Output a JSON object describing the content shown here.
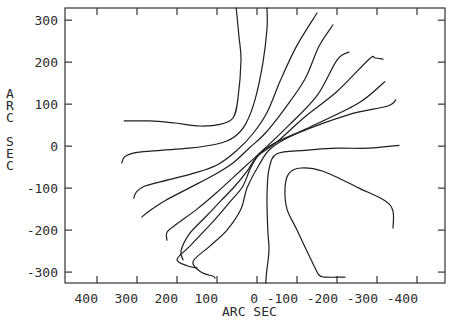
{
  "chart_data": {
    "type": "line",
    "subtype": "contour",
    "title": "",
    "xlabel": "ARC SEC",
    "ylabel": "ARC SEC",
    "xlim": [
      480,
      -470
    ],
    "ylim": [
      -326,
      329
    ],
    "x_reversed": true,
    "grid": false,
    "x_ticks": [
      400,
      300,
      200,
      100,
      0,
      -100,
      -200,
      -300,
      -400
    ],
    "x_tick_labels": [
      "400",
      "300",
      "200",
      "100",
      "0",
      "-100",
      "-200",
      "-300",
      "-400"
    ],
    "y_ticks": [
      300,
      200,
      100,
      0,
      -100,
      -200,
      -300
    ],
    "y_tick_labels": [
      "300",
      "200",
      "100",
      "0",
      "-100",
      "-200",
      "-300"
    ],
    "series": [
      {
        "name": "contour-1",
        "points": [
          [
            332,
            60
          ],
          [
            268,
            60
          ],
          [
            205,
            55
          ],
          [
            142,
            48
          ],
          [
            92,
            52
          ],
          [
            60,
            67
          ],
          [
            48,
            110
          ],
          [
            40,
            205
          ],
          [
            45,
            260
          ],
          [
            52,
            329
          ]
        ]
      },
      {
        "name": "contour-2",
        "points": [
          [
            338,
            -40
          ],
          [
            330,
            -25
          ],
          [
            300,
            -15
          ],
          [
            240,
            -10
          ],
          [
            170,
            -5
          ],
          [
            100,
            5
          ],
          [
            60,
            20
          ],
          [
            30,
            50
          ],
          [
            5,
            110
          ],
          [
            -15,
            200
          ],
          [
            -25,
            280
          ],
          [
            -25,
            329
          ]
        ]
      },
      {
        "name": "contour-3",
        "points": [
          [
            308,
            -124
          ],
          [
            302,
            -110
          ],
          [
            280,
            -95
          ],
          [
            220,
            -80
          ],
          [
            160,
            -65
          ],
          [
            100,
            -45
          ],
          [
            50,
            -10
          ],
          [
            10,
            30
          ],
          [
            -25,
            80
          ],
          [
            -60,
            160
          ],
          [
            -100,
            240
          ],
          [
            -150,
            317
          ]
        ]
      },
      {
        "name": "contour-4",
        "points": [
          [
            288,
            -169
          ],
          [
            270,
            -155
          ],
          [
            230,
            -130
          ],
          [
            170,
            -100
          ],
          [
            110,
            -70
          ],
          [
            60,
            -40
          ],
          [
            20,
            -5
          ],
          [
            -20,
            30
          ],
          [
            -70,
            90
          ],
          [
            -120,
            160
          ],
          [
            -155,
            238
          ],
          [
            -190,
            289
          ]
        ]
      },
      {
        "name": "contour-5",
        "points": [
          [
            225,
            -224
          ],
          [
            225,
            -205
          ],
          [
            200,
            -185
          ],
          [
            150,
            -150
          ],
          [
            100,
            -110
          ],
          [
            60,
            -75
          ],
          [
            20,
            -40
          ],
          [
            -20,
            -5
          ],
          [
            -80,
            50
          ],
          [
            -150,
            120
          ],
          [
            -200,
            205
          ],
          [
            -230,
            224
          ]
        ]
      },
      {
        "name": "contour-6",
        "points": [
          [
            185,
            -271
          ],
          [
            190,
            -250
          ],
          [
            170,
            -210
          ],
          [
            130,
            -170
          ],
          [
            90,
            -130
          ],
          [
            55,
            -95
          ],
          [
            25,
            -60
          ],
          [
            0,
            -25
          ],
          [
            -50,
            10
          ],
          [
            -120,
            70
          ],
          [
            -200,
            130
          ],
          [
            -280,
            207
          ],
          [
            -295,
            210
          ],
          [
            -315,
            207
          ]
        ]
      },
      {
        "name": "contour-7",
        "points": [
          [
            150,
            -290
          ],
          [
            175,
            -285
          ],
          [
            200,
            -270
          ],
          [
            170,
            -240
          ],
          [
            110,
            -180
          ],
          [
            65,
            -130
          ],
          [
            35,
            -95
          ],
          [
            15,
            -50
          ],
          [
            -10,
            -15
          ],
          [
            -50,
            10
          ],
          [
            -120,
            40
          ],
          [
            -250,
            100
          ],
          [
            -315,
            150
          ],
          [
            -315,
            150
          ]
        ]
      },
      {
        "name": "contour-8",
        "points": [
          [
            105,
            -314
          ],
          [
            110,
            -310
          ],
          [
            140,
            -300
          ],
          [
            160,
            -275
          ],
          [
            120,
            -240
          ],
          [
            75,
            -200
          ],
          [
            40,
            -150
          ],
          [
            25,
            -100
          ],
          [
            -5,
            -45
          ],
          [
            -35,
            -5
          ],
          [
            -100,
            30
          ],
          [
            -230,
            75
          ],
          [
            -325,
            95
          ],
          [
            -347,
            110
          ]
        ]
      },
      {
        "name": "contour-9",
        "points": [
          [
            -22,
            -326
          ],
          [
            -24,
            -300
          ],
          [
            -28,
            -270
          ],
          [
            -30,
            -240
          ],
          [
            -27,
            -200
          ],
          [
            -25,
            -120
          ],
          [
            -30,
            -55
          ],
          [
            -50,
            -18
          ],
          [
            -120,
            -10
          ],
          [
            -200,
            -5
          ],
          [
            -280,
            -5
          ],
          [
            -355,
            2
          ]
        ]
      },
      {
        "name": "contour-10",
        "points": [
          [
            -220,
            -312
          ],
          [
            -170,
            -312
          ],
          [
            -155,
            -307
          ],
          [
            -140,
            -280
          ],
          [
            -100,
            -200
          ],
          [
            -75,
            -150
          ],
          [
            -70,
            -100
          ],
          [
            -80,
            -65
          ],
          [
            -110,
            -52
          ],
          [
            -165,
            -60
          ],
          [
            -255,
            -100
          ],
          [
            -320,
            -130
          ],
          [
            -340,
            -155
          ],
          [
            -340,
            -195
          ]
        ]
      }
    ]
  }
}
